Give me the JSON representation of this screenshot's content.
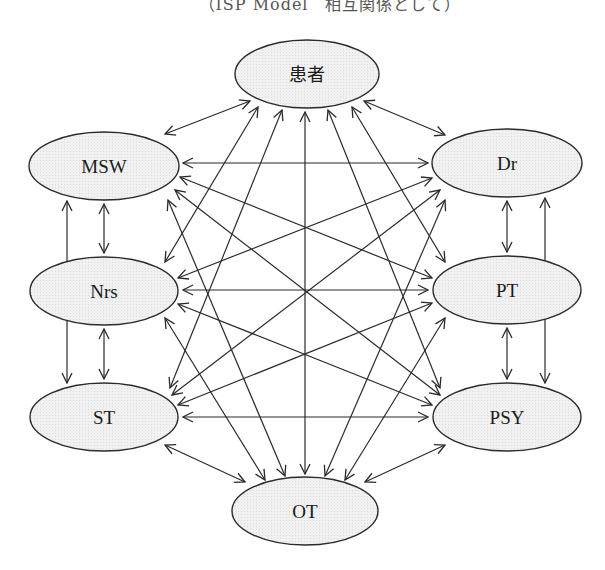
{
  "caption": "（ISP Model　相互関係として）",
  "colors": {
    "node_fill": "#efefef",
    "stroke": "#2b2b2b",
    "background": "#ffffff"
  },
  "nodes": [
    {
      "id": "patient",
      "label": "患者",
      "cx": 307,
      "cy": 74,
      "rx": 72,
      "ry": 34
    },
    {
      "id": "msw",
      "label": "MSW",
      "cx": 104,
      "cy": 166,
      "rx": 75,
      "ry": 34
    },
    {
      "id": "dr",
      "label": "Dr",
      "cx": 507,
      "cy": 163,
      "rx": 75,
      "ry": 34
    },
    {
      "id": "nrs",
      "label": "Nrs",
      "cx": 104,
      "cy": 291,
      "rx": 74,
      "ry": 34
    },
    {
      "id": "pt",
      "label": "PT",
      "cx": 507,
      "cy": 290,
      "rx": 74,
      "ry": 34
    },
    {
      "id": "st",
      "label": "ST",
      "cx": 104,
      "cy": 417,
      "rx": 74,
      "ry": 34
    },
    {
      "id": "psy",
      "label": "PSY",
      "cx": 507,
      "cy": 417,
      "rx": 74,
      "ry": 34
    },
    {
      "id": "ot",
      "label": "OT",
      "cx": 305,
      "cy": 511,
      "rx": 73,
      "ry": 34
    }
  ],
  "edges": [
    {
      "from": "patient",
      "to": "msw",
      "x1": 250,
      "y1": 101,
      "x2": 165,
      "y2": 134
    },
    {
      "from": "patient",
      "to": "dr",
      "x1": 364,
      "y1": 101,
      "x2": 445,
      "y2": 135
    },
    {
      "from": "patient",
      "to": "nrs",
      "x1": 258,
      "y1": 107,
      "x2": 165,
      "y2": 262
    },
    {
      "from": "patient",
      "to": "st",
      "x1": 282,
      "y1": 110,
      "x2": 170,
      "y2": 388
    },
    {
      "from": "patient",
      "to": "ot",
      "x1": 305,
      "y1": 112,
      "x2": 305,
      "y2": 474
    },
    {
      "from": "patient",
      "to": "psy",
      "x1": 328,
      "y1": 110,
      "x2": 440,
      "y2": 388
    },
    {
      "from": "patient",
      "to": "pt",
      "x1": 352,
      "y1": 107,
      "x2": 445,
      "y2": 262
    },
    {
      "from": "msw",
      "to": "dr",
      "x1": 183,
      "y1": 163,
      "x2": 428,
      "y2": 163
    },
    {
      "from": "msw",
      "to": "pt",
      "x1": 180,
      "y1": 177,
      "x2": 432,
      "y2": 278
    },
    {
      "from": "msw",
      "to": "psy",
      "x1": 175,
      "y1": 190,
      "x2": 440,
      "y2": 395
    },
    {
      "from": "msw",
      "to": "ot",
      "x1": 168,
      "y1": 200,
      "x2": 285,
      "y2": 476
    },
    {
      "from": "msw",
      "to": "nrs",
      "x1": 104,
      "y1": 204,
      "x2": 104,
      "y2": 253
    },
    {
      "from": "msw",
      "to": "st",
      "x1": 67,
      "y1": 201,
      "x2": 67,
      "y2": 383
    },
    {
      "from": "dr",
      "to": "nrs",
      "x1": 432,
      "y1": 178,
      "x2": 178,
      "y2": 278
    },
    {
      "from": "dr",
      "to": "st",
      "x1": 440,
      "y1": 190,
      "x2": 172,
      "y2": 395
    },
    {
      "from": "dr",
      "to": "ot",
      "x1": 445,
      "y1": 200,
      "x2": 325,
      "y2": 476
    },
    {
      "from": "dr",
      "to": "pt",
      "x1": 507,
      "y1": 201,
      "x2": 507,
      "y2": 252
    },
    {
      "from": "dr",
      "to": "psy",
      "x1": 545,
      "y1": 198,
      "x2": 545,
      "y2": 383
    },
    {
      "from": "nrs",
      "to": "pt",
      "x1": 183,
      "y1": 290,
      "x2": 428,
      "y2": 290
    },
    {
      "from": "nrs",
      "to": "psy",
      "x1": 178,
      "y1": 304,
      "x2": 432,
      "y2": 405
    },
    {
      "from": "nrs",
      "to": "ot",
      "x1": 165,
      "y1": 318,
      "x2": 265,
      "y2": 480
    },
    {
      "from": "nrs",
      "to": "st",
      "x1": 104,
      "y1": 329,
      "x2": 104,
      "y2": 379
    },
    {
      "from": "pt",
      "to": "st",
      "x1": 432,
      "y1": 303,
      "x2": 178,
      "y2": 405
    },
    {
      "from": "pt",
      "to": "ot",
      "x1": 445,
      "y1": 318,
      "x2": 345,
      "y2": 480
    },
    {
      "from": "pt",
      "to": "psy",
      "x1": 507,
      "y1": 328,
      "x2": 507,
      "y2": 379
    },
    {
      "from": "st",
      "to": "psy",
      "x1": 183,
      "y1": 417,
      "x2": 428,
      "y2": 417
    },
    {
      "from": "st",
      "to": "ot",
      "x1": 165,
      "y1": 445,
      "x2": 245,
      "y2": 482
    },
    {
      "from": "psy",
      "to": "ot",
      "x1": 445,
      "y1": 445,
      "x2": 365,
      "y2": 482
    }
  ]
}
